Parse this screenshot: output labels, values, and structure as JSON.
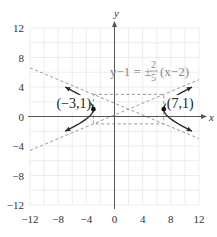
{
  "chart_data": {
    "type": "line",
    "title": "",
    "xlabel": "x",
    "ylabel": "y",
    "xlim": [
      -12,
      12
    ],
    "ylim": [
      -12,
      12
    ],
    "grid": true,
    "grid_step": 2,
    "x_ticks": [
      -12,
      -8,
      -4,
      0,
      4,
      8,
      12
    ],
    "y_ticks": [
      12,
      8,
      4,
      0,
      -4,
      -8,
      -12
    ],
    "x_tick_labels": [
      "−12",
      "−8",
      "−4",
      "0",
      "4",
      "8",
      "12"
    ],
    "y_tick_labels": [
      "12",
      "8",
      "4",
      "0",
      "−4",
      "−8",
      "−12"
    ],
    "hyperbola": {
      "equation": "(x-2)^2/25 - (y-1)^2/4 = 1",
      "center": [
        2,
        1
      ],
      "a": 5,
      "b": 2,
      "branch_x_extent": [
        -7,
        11
      ]
    },
    "asymptotes": {
      "label_lhs": "y−1 = ±",
      "label_num": "2",
      "label_den": "5",
      "label_rhs": "(x−2)",
      "lines": [
        {
          "slope": 0.4,
          "point": [
            2,
            1
          ],
          "x_range": [
            -12,
            12
          ]
        },
        {
          "slope": -0.4,
          "point": [
            2,
            1
          ],
          "x_range": [
            -12,
            12
          ]
        }
      ]
    },
    "fundamental_rectangle": {
      "x": [
        -3,
        7
      ],
      "y": [
        -1,
        3
      ]
    },
    "vertices": [
      {
        "x": -3,
        "y": 1,
        "label": "(−3,1)"
      },
      {
        "x": 7,
        "y": 1,
        "label": "(7,1)"
      }
    ],
    "colors": {
      "curve": "#2b2b2b",
      "dashed": "#9a9a9a",
      "grid": "#e8e8e8",
      "axis": "#555555",
      "equation": "#8a8a8a"
    }
  }
}
